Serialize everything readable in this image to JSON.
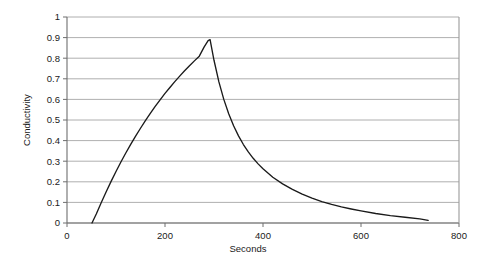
{
  "chart_data": {
    "type": "line",
    "title": "",
    "xlabel": "Seconds",
    "ylabel": "Conductivity",
    "xlim": [
      0,
      800
    ],
    "ylim": [
      0,
      1
    ],
    "grid": true,
    "legend": null,
    "legend_position": "none",
    "xticks": [
      0,
      200,
      400,
      600,
      800
    ],
    "xtick_labels": [
      "0",
      "200",
      "400",
      "600",
      "800"
    ],
    "yticks": [
      0,
      0.1,
      0.2,
      0.3,
      0.4,
      0.5,
      0.6,
      0.7,
      0.8,
      0.9,
      1
    ],
    "ytick_labels": [
      "0",
      "0.1",
      "0.2",
      "0.3",
      "0.4",
      "0.5",
      "0.6",
      "0.7",
      "0.8",
      "0.9",
      "1"
    ],
    "series": [
      {
        "name": "Conductivity",
        "color": "#1a1a1a",
        "x": [
          51,
          60,
          70,
          80,
          90,
          100,
          110,
          120,
          130,
          140,
          150,
          160,
          170,
          180,
          190,
          200,
          210,
          220,
          230,
          240,
          250,
          260,
          270,
          280,
          288,
          292,
          300,
          310,
          320,
          330,
          340,
          350,
          360,
          370,
          380,
          390,
          400,
          420,
          440,
          460,
          480,
          500,
          520,
          540,
          560,
          580,
          600,
          630,
          660,
          690,
          720,
          737
        ],
        "y": [
          0.0,
          0.045,
          0.1,
          0.152,
          0.202,
          0.25,
          0.296,
          0.34,
          0.382,
          0.422,
          0.46,
          0.497,
          0.532,
          0.566,
          0.598,
          0.629,
          0.658,
          0.686,
          0.713,
          0.739,
          0.763,
          0.787,
          0.81,
          0.855,
          0.885,
          0.89,
          0.79,
          0.685,
          0.6,
          0.53,
          0.472,
          0.423,
          0.381,
          0.345,
          0.314,
          0.287,
          0.263,
          0.222,
          0.19,
          0.163,
          0.14,
          0.121,
          0.104,
          0.09,
          0.078,
          0.068,
          0.059,
          0.046,
          0.036,
          0.028,
          0.02,
          0.013
        ]
      }
    ],
    "annotations": [],
    "peak": {
      "x": 292,
      "y": 0.89
    },
    "onset": {
      "x": 51,
      "y": 0
    }
  },
  "axes": {
    "x_title": "Seconds",
    "y_title": "Conductivity"
  },
  "colors": {
    "series": "#1a1a1a",
    "grid": "#9a9a9a",
    "axis": "#6e6e6e",
    "background": "#ffffff"
  }
}
